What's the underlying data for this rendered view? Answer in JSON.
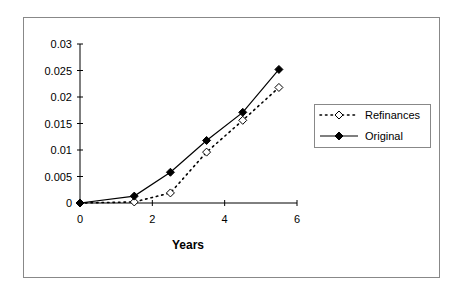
{
  "chart_data": {
    "type": "line",
    "title": "",
    "xlabel": "Years",
    "ylabel": "",
    "xlim": [
      0,
      6
    ],
    "ylim": [
      0,
      0.03
    ],
    "x_ticks": [
      "0",
      "2",
      "4",
      "6"
    ],
    "y_ticks": [
      "0",
      "0.005",
      "0.01",
      "0.015",
      "0.02",
      "0.025",
      "0.03"
    ],
    "grid": false,
    "legend_position": "right",
    "series": [
      {
        "name": "Refinances",
        "style": "dotted",
        "marker": "open-diamond",
        "x": [
          0,
          1.5,
          2.5,
          3.5,
          4.5,
          5.5
        ],
        "y": [
          0,
          0.0002,
          0.0019,
          0.0096,
          0.0156,
          0.0218
        ]
      },
      {
        "name": "Original",
        "style": "solid",
        "marker": "filled-diamond",
        "x": [
          0,
          1.5,
          2.5,
          3.5,
          4.5,
          5.5
        ],
        "y": [
          0,
          0.0013,
          0.0058,
          0.0118,
          0.0171,
          0.0252
        ]
      }
    ]
  },
  "colors": {
    "line": "#000000",
    "frame": "#888888",
    "background": "#ffffff"
  }
}
